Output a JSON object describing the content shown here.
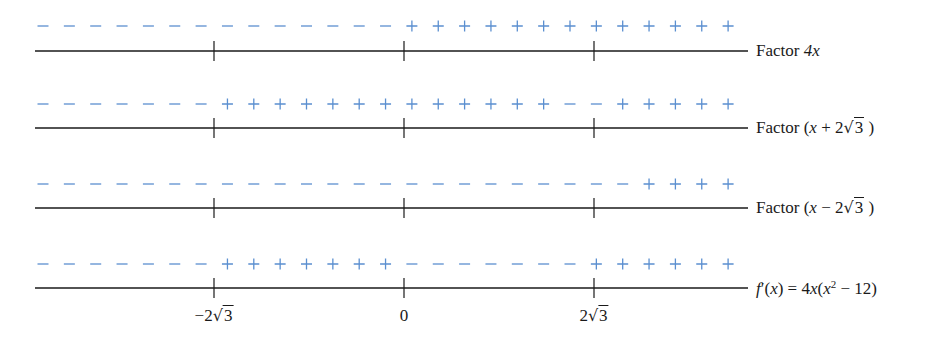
{
  "chart_data": {
    "type": "sign-chart",
    "title": "",
    "axis": {
      "tick_labels": [
        "−2√3",
        "0",
        "2√3"
      ],
      "tick_values": [
        -3.464,
        0,
        3.464
      ]
    },
    "rows": [
      {
        "label": "Factor 4x",
        "signs": "--------------+++++++++++++",
        "interval_signs": [
          "-",
          "-",
          "+",
          "+"
        ]
      },
      {
        "label": "Factor (x + 2√3)",
        "signs": "-------+++++++++++++--+++++",
        "interval_signs": [
          "-",
          "+",
          "+",
          "+"
        ]
      },
      {
        "label": "Factor (x − 2√3)",
        "signs": "-----------------------++++",
        "interval_signs": [
          "-",
          "-",
          "-",
          "+"
        ]
      },
      {
        "label": "f′(x) = 4x(x² − 12)",
        "signs": "-------+++++++-------++++++",
        "interval_signs": [
          "-",
          "+",
          "-",
          "+"
        ]
      }
    ],
    "colors": {
      "signs": "#5b8fd0",
      "axis": "#1a1a1a"
    }
  },
  "rows": [
    {
      "label_prefix": "Factor ",
      "label_var": "4x"
    },
    {
      "label_prefix": "Factor (",
      "label_var": "x",
      "label_op": " + 2",
      "label_rad": "3",
      "label_suffix": " )"
    },
    {
      "label_prefix": "Factor (",
      "label_var": "x",
      "label_op": " − 2",
      "label_rad": "3",
      "label_suffix": " )"
    },
    {
      "label_f": "f",
      "label_rest": "′(",
      "label_x": "x",
      "label_eq": ") = 4",
      "label_x2": "x",
      "label_paren": "(",
      "label_x3": "x",
      "label_exp": "2",
      "label_end": " − 12)"
    }
  ],
  "ticks": {
    "neg": {
      "prefix": "−2",
      "rad": "3"
    },
    "zero": "0",
    "pos": {
      "prefix": "2",
      "rad": "3"
    }
  }
}
